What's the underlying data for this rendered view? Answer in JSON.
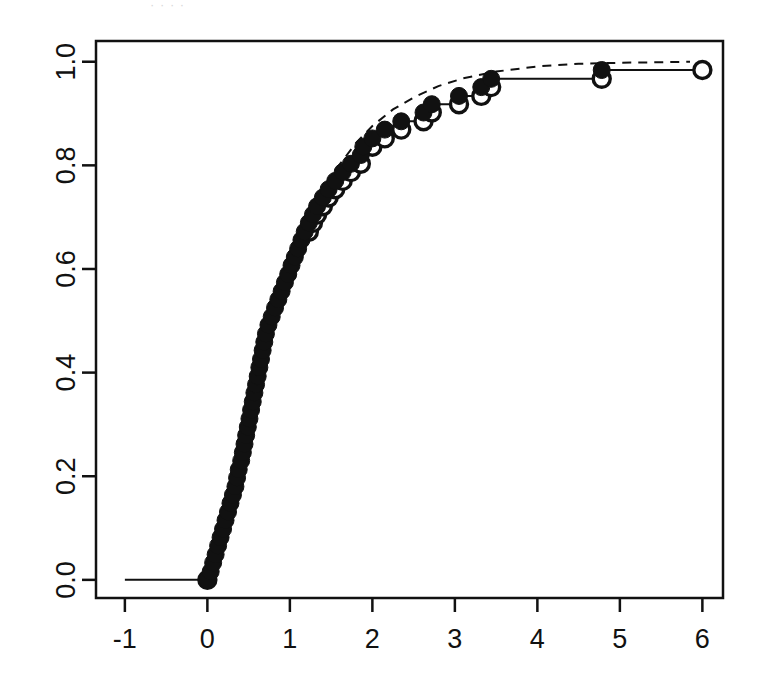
{
  "figure": {
    "background": "#ffffff",
    "ink_color": "#111111",
    "caption_sliver": "·  ·     ·           ·",
    "plot_box": {
      "left": 96,
      "top": 41,
      "right": 723,
      "bottom": 598
    }
  },
  "chart_data": {
    "type": "line",
    "subtype": "ecdf-step-with-fitted-cdf",
    "title": "",
    "subtitle": "",
    "xlabel": "",
    "ylabel": "",
    "xlim": [
      -1.35,
      6.25
    ],
    "ylim": [
      -0.035,
      1.04
    ],
    "xticks": [
      -1,
      0,
      1,
      2,
      3,
      4,
      5,
      6
    ],
    "xtick_labels": [
      "-1",
      "0",
      "1",
      "2",
      "3",
      "4",
      "5",
      "6"
    ],
    "yticks": [
      0.0,
      0.2,
      0.4,
      0.6,
      0.8,
      1.0
    ],
    "ytick_labels": [
      "0.0",
      "0.2",
      "0.4",
      "0.6",
      "0.8",
      "1.0"
    ],
    "grid": false,
    "legend": null,
    "frame": "box",
    "series": [
      {
        "name": "Empirical CDF (step)",
        "style": "solid-step",
        "linewidth": 2,
        "color": "#111111",
        "point_style_upper": "filled-circle",
        "point_style_lower": "open-circle",
        "x": [
          0.0,
          0.04,
          0.07,
          0.1,
          0.13,
          0.16,
          0.19,
          0.22,
          0.25,
          0.28,
          0.31,
          0.34,
          0.36,
          0.38,
          0.41,
          0.43,
          0.45,
          0.47,
          0.49,
          0.51,
          0.53,
          0.55,
          0.57,
          0.59,
          0.61,
          0.63,
          0.65,
          0.67,
          0.69,
          0.71,
          0.74,
          0.78,
          0.82,
          0.86,
          0.9,
          0.94,
          0.98,
          1.02,
          1.06,
          1.1,
          1.14,
          1.18,
          1.23,
          1.28,
          1.33,
          1.4,
          1.47,
          1.55,
          1.64,
          1.74,
          1.86,
          1.89,
          2.0,
          2.15,
          2.35,
          2.62,
          2.72,
          3.05,
          3.32,
          3.44,
          4.78
        ],
        "y": [
          0.0,
          0.016,
          0.033,
          0.049,
          0.066,
          0.082,
          0.098,
          0.115,
          0.131,
          0.148,
          0.164,
          0.18,
          0.197,
          0.213,
          0.23,
          0.246,
          0.262,
          0.279,
          0.295,
          0.311,
          0.328,
          0.344,
          0.361,
          0.377,
          0.393,
          0.41,
          0.426,
          0.443,
          0.459,
          0.475,
          0.492,
          0.508,
          0.525,
          0.541,
          0.557,
          0.574,
          0.59,
          0.607,
          0.623,
          0.639,
          0.656,
          0.672,
          0.689,
          0.705,
          0.721,
          0.738,
          0.754,
          0.77,
          0.787,
          0.803,
          0.82,
          0.836,
          0.852,
          0.869,
          0.885,
          0.902,
          0.918,
          0.934,
          0.951,
          0.967,
          0.984
        ]
      },
      {
        "name": "Fitted CDF (theoretical)",
        "style": "dashed",
        "linewidth": 2,
        "dash": "9,7",
        "color": "#111111",
        "x": [
          0.0,
          0.1,
          0.2,
          0.3,
          0.4,
          0.5,
          0.6,
          0.7,
          0.8,
          0.9,
          1.0,
          1.15,
          1.3,
          1.45,
          1.6,
          1.8,
          2.0,
          2.25,
          2.5,
          2.8,
          3.1,
          3.5,
          4.0,
          4.5,
          5.0,
          5.5,
          5.85
        ],
        "y": [
          0.0,
          0.048,
          0.107,
          0.172,
          0.239,
          0.306,
          0.371,
          0.433,
          0.491,
          0.545,
          0.594,
          0.659,
          0.715,
          0.762,
          0.801,
          0.843,
          0.876,
          0.908,
          0.931,
          0.953,
          0.968,
          0.981,
          0.991,
          0.996,
          0.998,
          0.999,
          1.0
        ]
      }
    ],
    "baseline_segment": {
      "x_from": -1.0,
      "x_to": 0.0,
      "y": 0.0
    },
    "tail_segment": {
      "x_from": 4.78,
      "x_to": 6.0,
      "y": 1.0
    },
    "n_observations": 61
  }
}
